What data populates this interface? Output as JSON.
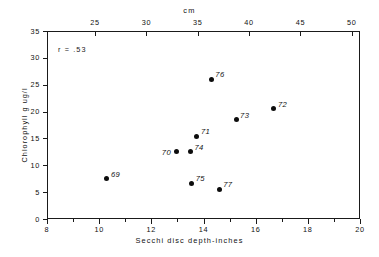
{
  "chart_data": {
    "type": "scatter",
    "title": "",
    "xlabel": "Secchi disc depth-inches",
    "ylabel": "Chlorophyll g ug/l",
    "top_axis_label": "cm",
    "xlim": [
      8,
      20
    ],
    "ylim": [
      0,
      35
    ],
    "top_xlim": [
      20.32,
      50.8
    ],
    "grid": false,
    "legend": false,
    "annotation": "r = .53",
    "xticks": [
      8,
      10,
      12,
      14,
      16,
      18,
      20
    ],
    "xtick_labels": [
      "8",
      "10",
      "12",
      "14",
      "16",
      "18",
      "20"
    ],
    "xminorticks": [
      9,
      11,
      13,
      15,
      17,
      19
    ],
    "yticks": [
      0,
      5,
      10,
      15,
      20,
      25,
      30,
      35
    ],
    "ytick_labels": [
      "0",
      "5",
      "10",
      "15",
      "20",
      "25",
      "30",
      "35"
    ],
    "top_xticks": [
      25,
      30,
      35,
      40,
      45,
      50
    ],
    "top_xtick_labels": [
      "25",
      "30",
      "35",
      "40",
      "45",
      "50"
    ],
    "points": [
      {
        "label": "69",
        "x": 10.3,
        "y": 7.5,
        "label_side": "right"
      },
      {
        "label": "70",
        "x": 12.95,
        "y": 12.5,
        "label_side": "left"
      },
      {
        "label": "71",
        "x": 13.75,
        "y": 15.4,
        "label_side": "right"
      },
      {
        "label": "74",
        "x": 13.5,
        "y": 12.5,
        "label_side": "right"
      },
      {
        "label": "75",
        "x": 13.55,
        "y": 6.7,
        "label_side": "right"
      },
      {
        "label": "76",
        "x": 14.3,
        "y": 26.0,
        "label_side": "right"
      },
      {
        "label": "77",
        "x": 14.6,
        "y": 5.5,
        "label_side": "right"
      },
      {
        "label": "73",
        "x": 15.25,
        "y": 18.5,
        "label_side": "right"
      },
      {
        "label": "72",
        "x": 16.7,
        "y": 20.5,
        "label_side": "right"
      }
    ]
  },
  "colors": {
    "axis": "#1a1a1a",
    "marker": "#0d0d0d",
    "text": "#111111",
    "background": "#ffffff"
  }
}
